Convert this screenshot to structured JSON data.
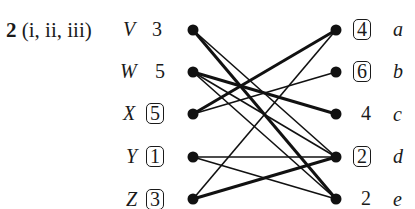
{
  "question": {
    "number": "2",
    "parts": "(i, ii, iii)"
  },
  "left_nodes": [
    {
      "name": "V",
      "value": "3",
      "boxed": false
    },
    {
      "name": "W",
      "value": "5",
      "boxed": false
    },
    {
      "name": "X",
      "value": "5",
      "boxed": true
    },
    {
      "name": "Y",
      "value": "1",
      "boxed": true
    },
    {
      "name": "Z",
      "value": "3",
      "boxed": true
    }
  ],
  "right_nodes": [
    {
      "name": "a",
      "value": "4",
      "boxed": true
    },
    {
      "name": "b",
      "value": "6",
      "boxed": true
    },
    {
      "name": "c",
      "value": "4",
      "boxed": false
    },
    {
      "name": "d",
      "value": "2",
      "boxed": true
    },
    {
      "name": "e",
      "value": "2",
      "boxed": false
    }
  ],
  "edges": [
    {
      "from": "V",
      "to": "e",
      "weight": "thick"
    },
    {
      "from": "V",
      "to": "d",
      "weight": "thin"
    },
    {
      "from": "W",
      "to": "c",
      "weight": "thick"
    },
    {
      "from": "W",
      "to": "d",
      "weight": "thin"
    },
    {
      "from": "W",
      "to": "e",
      "weight": "thin"
    },
    {
      "from": "X",
      "to": "a",
      "weight": "thick"
    },
    {
      "from": "X",
      "to": "b",
      "weight": "thin"
    },
    {
      "from": "Y",
      "to": "d",
      "weight": "thin"
    },
    {
      "from": "Y",
      "to": "e",
      "weight": "thin"
    },
    {
      "from": "Z",
      "to": "d",
      "weight": "thick"
    },
    {
      "from": "Z",
      "to": "a",
      "weight": "thin"
    }
  ]
}
